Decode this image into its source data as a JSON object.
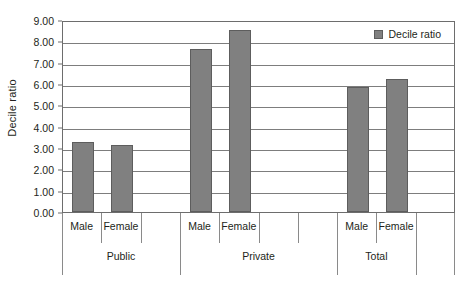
{
  "chart_data": {
    "type": "bar",
    "title": "",
    "subtitle": "",
    "xlabel": "",
    "ylabel": "Decile ratio",
    "ylim": [
      0.0,
      9.0
    ],
    "ytick_step": 1.0,
    "ytick_labels": [
      "0.00",
      "1.00",
      "2.00",
      "3.00",
      "4.00",
      "5.00",
      "6.00",
      "7.00",
      "8.00",
      "9.00"
    ],
    "ytick_values": [
      0.0,
      1.0,
      2.0,
      3.0,
      4.0,
      5.0,
      6.0,
      7.0,
      8.0,
      9.0
    ],
    "grid": true,
    "grid_axis": "y",
    "legend": {
      "position": "top-right",
      "entries": [
        {
          "label": "Decile ratio",
          "color": "#808080"
        }
      ]
    },
    "groups": [
      "Public",
      "Private",
      "Total"
    ],
    "categories": [
      "Male",
      "Female",
      "Male",
      "Female",
      "Male",
      "Female"
    ],
    "series": [
      {
        "name": "Decile ratio",
        "color": "#808080",
        "values": [
          3.28,
          3.12,
          7.65,
          8.55,
          5.85,
          6.25
        ]
      }
    ],
    "bars": [
      {
        "group": "Public",
        "category": "Male",
        "value": 3.28
      },
      {
        "group": "Public",
        "category": "Female",
        "value": 3.12
      },
      {
        "group": "Private",
        "category": "Male",
        "value": 7.65
      },
      {
        "group": "Private",
        "category": "Female",
        "value": 8.55
      },
      {
        "group": "Total",
        "category": "Male",
        "value": 5.85
      },
      {
        "group": "Total",
        "category": "Female",
        "value": 6.25
      }
    ]
  },
  "axis": {
    "y_title": "Decile ratio"
  },
  "colors": {
    "bar_fill": "#808080",
    "bar_stroke": "#5d5d5d",
    "gridline": "#7d7d7d",
    "frame": "#6d6d6d",
    "text": "#231f20",
    "background": "#ffffff"
  }
}
